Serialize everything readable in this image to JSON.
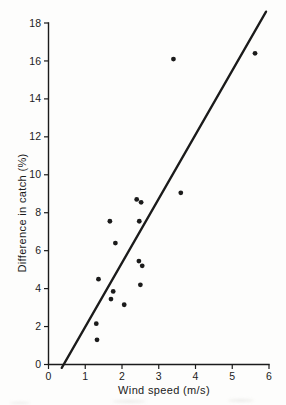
{
  "figure": {
    "background": "#fdfdfc",
    "ink": "#1b1b1b"
  },
  "chart_data": {
    "type": "scatter",
    "title": "",
    "xlabel": "Wind speed (m/s)",
    "ylabel": "Difference in catch (%)",
    "xlim": [
      0,
      6
    ],
    "ylim": [
      0,
      18
    ],
    "xticks": [
      0,
      1,
      2,
      3,
      4,
      5,
      6
    ],
    "yticks": [
      0,
      2,
      4,
      6,
      8,
      10,
      12,
      14,
      16,
      18
    ],
    "grid": false,
    "legend": "none",
    "marker": {
      "shape": "filled-circle",
      "radius_px": 2.4,
      "color": "#1b1b1b"
    },
    "points": [
      {
        "x": 1.3,
        "y": 2.15
      },
      {
        "x": 1.32,
        "y": 1.3
      },
      {
        "x": 1.36,
        "y": 4.5
      },
      {
        "x": 1.67,
        "y": 7.55
      },
      {
        "x": 1.7,
        "y": 3.45
      },
      {
        "x": 1.76,
        "y": 3.85
      },
      {
        "x": 1.82,
        "y": 6.4
      },
      {
        "x": 2.06,
        "y": 3.15
      },
      {
        "x": 2.4,
        "y": 8.7
      },
      {
        "x": 2.46,
        "y": 5.45
      },
      {
        "x": 2.47,
        "y": 7.55
      },
      {
        "x": 2.5,
        "y": 4.2
      },
      {
        "x": 2.52,
        "y": 8.55
      },
      {
        "x": 2.55,
        "y": 5.2
      },
      {
        "x": 3.4,
        "y": 16.1
      },
      {
        "x": 3.6,
        "y": 9.05
      },
      {
        "x": 5.62,
        "y": 16.4
      }
    ],
    "fit_line": {
      "x1": 0.36,
      "y1": -0.18,
      "x2": 5.92,
      "y2": 18.6,
      "stroke_px": 2.3
    }
  }
}
